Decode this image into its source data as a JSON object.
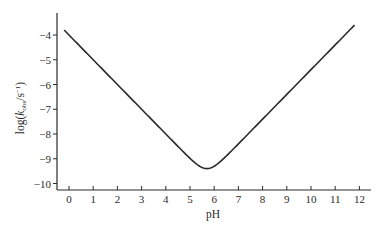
{
  "chart_data": {
    "type": "line",
    "title": "",
    "xlabel": "pH",
    "ylabel": "log(k_obs/s^-1)",
    "ylabel_parts": {
      "prefix": "log(",
      "k": "k",
      "sub": "obs",
      "suffix": "/s",
      "sup": "−1",
      "close": ")"
    },
    "xlim": [
      -0.5,
      12.4
    ],
    "ylim": [
      -10.3,
      -3.1
    ],
    "x_ticks": [
      0,
      1,
      2,
      3,
      4,
      5,
      6,
      7,
      8,
      9,
      10,
      11,
      12
    ],
    "x_tick_labels": [
      "0",
      "1",
      "2",
      "3",
      "4",
      "5",
      "6",
      "7",
      "8",
      "9",
      "10",
      "11",
      "12"
    ],
    "y_ticks": [
      -4,
      -5,
      -6,
      -7,
      -8,
      -9,
      -10
    ],
    "y_tick_labels": [
      "−4",
      "−5",
      "−6",
      "−7",
      "−8",
      "−9",
      "−10"
    ],
    "grid": false,
    "legend": null,
    "series": [
      {
        "name": "log k_obs vs pH",
        "model": "log10(10^(-4 - pH) + 10^(pH - 15.4))",
        "x": [
          -0.2,
          0,
          1,
          2,
          3,
          4,
          5,
          5.3,
          5.6,
          5.9,
          6.5,
          7,
          8,
          9,
          10,
          11,
          11.8
        ],
        "y": [
          -3.8,
          -4.0,
          -5.0,
          -6.0,
          -7.0,
          -8.0,
          -8.96,
          -9.19,
          -9.36,
          -9.35,
          -8.89,
          -8.4,
          -7.4,
          -6.4,
          -5.4,
          -4.4,
          -3.6
        ]
      }
    ],
    "line_color": "#2a2a2a"
  }
}
